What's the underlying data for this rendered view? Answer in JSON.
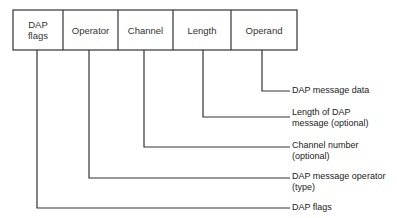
{
  "fields": [
    {
      "label": "DAP\nflags"
    },
    {
      "label": "Operator"
    },
    {
      "label": "Channel"
    },
    {
      "label": "Length"
    },
    {
      "label": "Operand"
    }
  ],
  "descriptions": [
    {
      "text": "DAP message data"
    },
    {
      "text": "Length of DAP\nmessage (optional)"
    },
    {
      "text": "Channel number\n(optional)"
    },
    {
      "text": "DAP message operator\n(type)"
    },
    {
      "text": "DAP flags"
    }
  ],
  "colors": {
    "line": "#333333",
    "text": "#222222"
  }
}
